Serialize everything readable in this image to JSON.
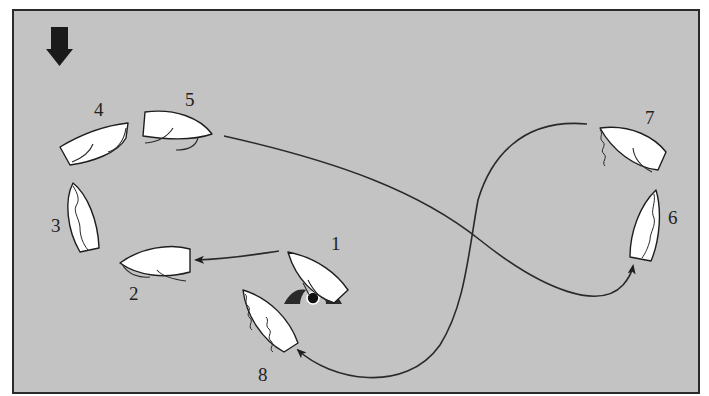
{
  "diagram": {
    "background_color": "#c3c3c3",
    "frame_color": "#2a2a2a",
    "wind": {
      "icon": "wind-direction-arrow-icon",
      "direction": "down"
    },
    "mark": {
      "icon": "buoy-mark-icon",
      "position": [
        313,
        298
      ]
    },
    "boats": [
      {
        "id": 1,
        "label": "1",
        "label_pos": [
          331,
          250
        ]
      },
      {
        "id": 2,
        "label": "2",
        "label_pos": [
          129,
          300
        ]
      },
      {
        "id": 3,
        "label": "3",
        "label_pos": [
          51,
          232
        ]
      },
      {
        "id": 4,
        "label": "4",
        "label_pos": [
          94,
          116
        ]
      },
      {
        "id": 5,
        "label": "5",
        "label_pos": [
          185,
          106
        ]
      },
      {
        "id": 6,
        "label": "6",
        "label_pos": [
          668,
          224
        ]
      },
      {
        "id": 7,
        "label": "7",
        "label_pos": [
          645,
          124
        ]
      },
      {
        "id": 8,
        "label": "8",
        "label_pos": [
          258,
          381
        ]
      }
    ],
    "tracks": [
      {
        "from": "1",
        "to": "2",
        "arrow": true
      },
      {
        "from": "5",
        "to": "6",
        "arrow": true
      },
      {
        "from": "7",
        "to": "8",
        "arrow": true
      }
    ]
  }
}
